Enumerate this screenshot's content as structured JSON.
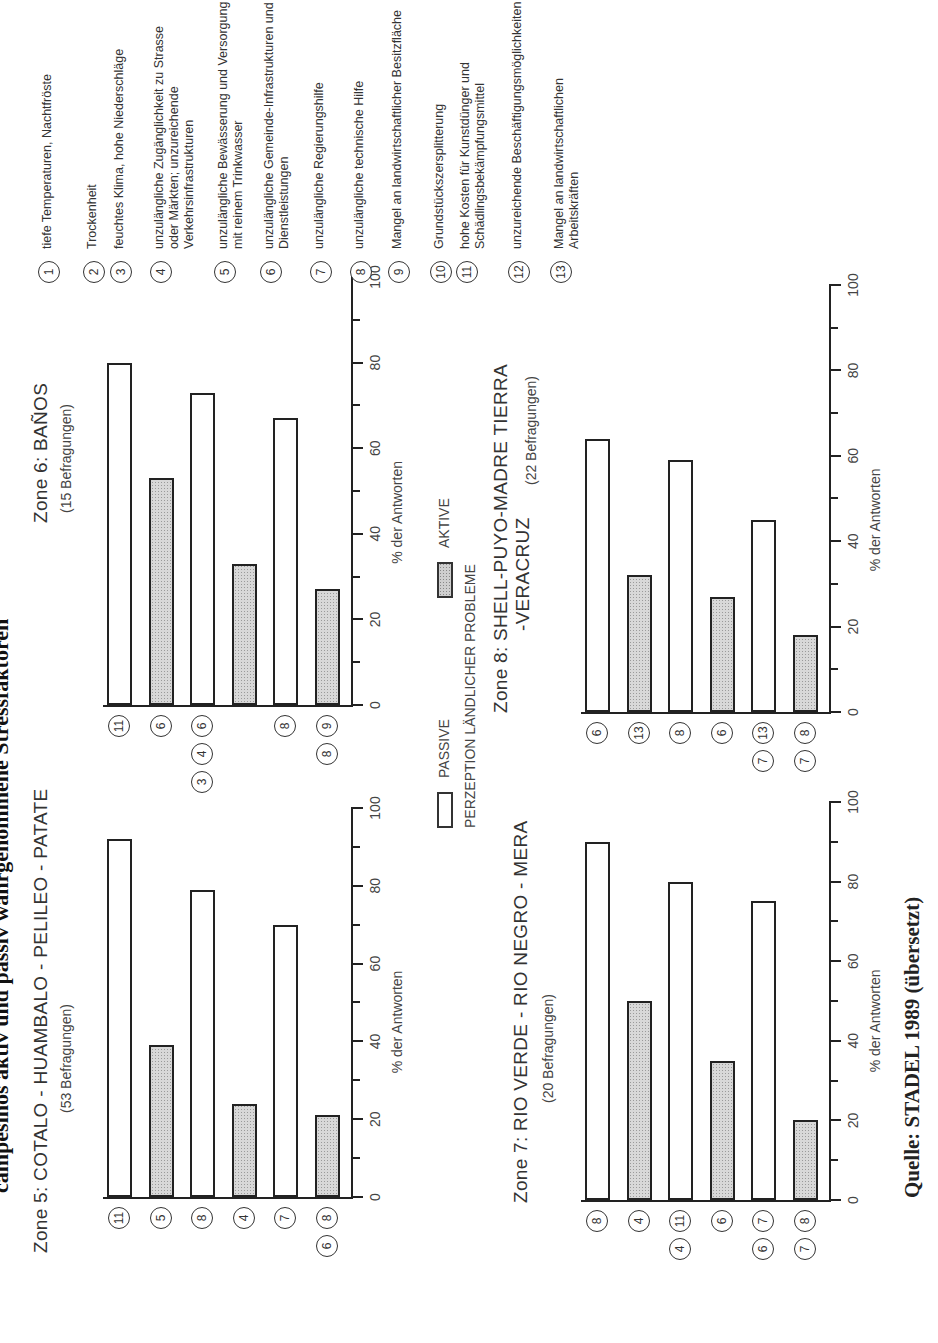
{
  "title": "campesinos aktiv und passiv wahrgenommene Stressfaktoren",
  "axis_title": "% der Antworten",
  "ticks": [
    "0",
    "20",
    "40",
    "60",
    "80",
    "100"
  ],
  "legend": {
    "passive": "PASSIVE",
    "active": "AKTIVE",
    "caption": "PERZEPTION LÄNDLICHER PROBLEME"
  },
  "source": "Quelle: STADEL 1989 (übersetzt)",
  "key": [
    {
      "n": "1",
      "text": "tiefe Temperaturen, Nachtfröste"
    },
    {
      "n": "2",
      "text": "Trockenheit"
    },
    {
      "n": "3",
      "text": "feuchtes Klima, hohe Niederschläge"
    },
    {
      "n": "4",
      "text": "unzulängliche Zugänglichkeit zu Strasse oder Märkten; unzureichende Verkehrsinfrastrukturen"
    },
    {
      "n": "5",
      "text": "unzulängliche Bewässerung und Versorgung mit reinem Trinkwasser"
    },
    {
      "n": "6",
      "text": "unzulängliche Gemeinde-Infrastrukturen und Dienstleistungen"
    },
    {
      "n": "7",
      "text": "unzulängliche Regierungshilfe"
    },
    {
      "n": "8",
      "text": "unzulängliche technische Hilfe"
    },
    {
      "n": "9",
      "text": "Mangel an landwirtschaftlicher Besitzfläche"
    },
    {
      "n": "10",
      "text": "Grundstückszersplitterung"
    },
    {
      "n": "11",
      "text": "hohe Kosten für Kunstdünger und Schädlingsbekämpfungsmittel"
    },
    {
      "n": "12",
      "text": "unzureichende Beschäftigungsmöglichkeiten"
    },
    {
      "n": "13",
      "text": "Mangel an landwirtschaftlichen Arbeitskräften"
    }
  ],
  "chart_data": [
    {
      "type": "bar",
      "orientation": "horizontal",
      "title": "Zone 5: COTALO - HUAMBALO - PELILEO - PATATE",
      "subtitle": "(53 Befragungen)",
      "xlabel": "% der Antworten",
      "xlim": [
        0,
        100
      ],
      "categories": [
        [
          "11"
        ],
        [
          "5"
        ],
        [
          "8"
        ],
        [
          "4"
        ],
        [
          "7"
        ],
        [
          "8",
          "6"
        ]
      ],
      "types": [
        "passive",
        "active",
        "passive",
        "active",
        "passive",
        "active"
      ],
      "values": [
        92,
        39,
        79,
        24,
        70,
        21
      ]
    },
    {
      "type": "bar",
      "orientation": "horizontal",
      "title": "Zone 6: BAÑOS",
      "subtitle": "(15 Befragungen)",
      "xlabel": "% der Antworten",
      "xlim": [
        0,
        100
      ],
      "categories": [
        [
          "11"
        ],
        [
          "6"
        ],
        [
          "6",
          "4",
          "3"
        ],
        [],
        [
          "8"
        ],
        [
          "9",
          "8"
        ]
      ],
      "types": [
        "passive",
        "active",
        "passive",
        "active",
        "passive",
        "active"
      ],
      "values": [
        80,
        53,
        73,
        33,
        67,
        27
      ]
    },
    {
      "type": "bar",
      "orientation": "horizontal",
      "title": "Zone 7: RIO VERDE - RIO NEGRO - MERA",
      "subtitle": "(20 Befragungen)",
      "xlabel": "% der Antworten",
      "xlim": [
        0,
        100
      ],
      "categories": [
        [
          "8"
        ],
        [
          "4"
        ],
        [
          "11",
          "4"
        ],
        [
          "6"
        ],
        [
          "7",
          "6"
        ],
        [
          "8",
          "7"
        ]
      ],
      "types": [
        "passive",
        "active",
        "passive",
        "active",
        "passive",
        "active"
      ],
      "values": [
        90,
        50,
        80,
        35,
        75,
        20
      ]
    },
    {
      "type": "bar",
      "orientation": "horizontal",
      "title": "Zone 8: SHELL-PUYO-MADRE TIERRA -VERACRUZ",
      "subtitle": "(22 Befragungen)",
      "xlabel": "% der Antworten",
      "xlim": [
        0,
        100
      ],
      "categories": [
        [
          "6"
        ],
        [
          "13"
        ],
        [
          "8"
        ],
        [
          "6"
        ],
        [
          "13",
          "7"
        ],
        [
          "8",
          "7"
        ]
      ],
      "types": [
        "passive",
        "active",
        "passive",
        "active",
        "passive",
        "active"
      ],
      "values": [
        64,
        32,
        59,
        27,
        45,
        18
      ]
    }
  ]
}
